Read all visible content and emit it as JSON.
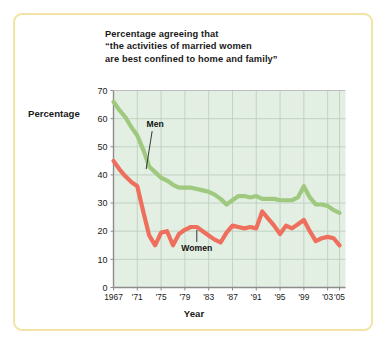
{
  "figure": {
    "title_lines": [
      "Percentage agreeing that",
      "“the activities of married women",
      "are best confined to home and family”"
    ],
    "y_axis_label": "Percentage",
    "x_axis_label": "Year",
    "border_color": "#f3e3a4",
    "plot_background": "#e3efe2",
    "grid_color": "#b9cbbb"
  },
  "chart_data": {
    "type": "line",
    "title": "Percentage agreeing that “the activities of married women are best confined to home and family”",
    "xlabel": "Year",
    "ylabel": "Percentage",
    "xlim": [
      1967,
      2006
    ],
    "ylim": [
      0,
      70
    ],
    "yticks": [
      0,
      10,
      20,
      30,
      40,
      50,
      60,
      70
    ],
    "ytick_labels": [
      "0",
      "10",
      "20",
      "30",
      "40",
      "50",
      "60",
      "70"
    ],
    "xticks": [
      1967,
      1971,
      1975,
      1979,
      1983,
      1987,
      1991,
      1995,
      1999,
      2003,
      2005
    ],
    "xtick_labels": [
      "1967",
      "'71",
      "'75",
      "'79",
      "'83",
      "'87",
      "'91",
      "'95",
      "'99",
      "'03",
      "'05"
    ],
    "grid": true,
    "legend": "inline-annotations",
    "series": [
      {
        "name": "Men",
        "color": "#9ec97f",
        "label_x": 1974,
        "label_y": 57,
        "x": [
          1967,
          1968,
          1969,
          1970,
          1971,
          1972,
          1973,
          1974,
          1975,
          1976,
          1977,
          1978,
          1979,
          1980,
          1981,
          1982,
          1983,
          1984,
          1985,
          1986,
          1987,
          1988,
          1989,
          1990,
          1991,
          1992,
          1993,
          1994,
          1995,
          1996,
          1997,
          1998,
          1999,
          2000,
          2001,
          2002,
          2003,
          2004,
          2005
        ],
        "y": [
          66,
          63,
          60.5,
          57,
          54,
          49,
          43,
          41,
          39,
          38,
          36.5,
          35.5,
          35.5,
          35.5,
          35,
          34.5,
          34,
          33,
          31.5,
          29.5,
          31,
          32.5,
          32.5,
          32,
          32.5,
          31.5,
          31.5,
          31.5,
          31,
          31,
          31,
          32,
          36,
          32,
          29.5,
          29.5,
          29,
          27.5,
          26.5
        ]
      },
      {
        "name": "Women",
        "color": "#ee6f5d",
        "label_x": 1981,
        "label_y": 13,
        "x": [
          1967,
          1968,
          1969,
          1970,
          1971,
          1972,
          1973,
          1974,
          1975,
          1976,
          1977,
          1978,
          1979,
          1980,
          1981,
          1982,
          1983,
          1984,
          1985,
          1986,
          1987,
          1988,
          1989,
          1990,
          1991,
          1992,
          1993,
          1994,
          1995,
          1996,
          1997,
          1998,
          1999,
          2000,
          2001,
          2002,
          2003,
          2004,
          2005
        ],
        "y": [
          45,
          42,
          39.5,
          37.5,
          36,
          27,
          18.5,
          15,
          19.5,
          20,
          15,
          19,
          20.5,
          21.5,
          21.5,
          20,
          18.5,
          17,
          16,
          19.5,
          22,
          21.5,
          21,
          21.5,
          21,
          27,
          24.5,
          22,
          19,
          22,
          21,
          22.5,
          24,
          20,
          16.5,
          17.5,
          18,
          17.5,
          15
        ]
      }
    ]
  }
}
